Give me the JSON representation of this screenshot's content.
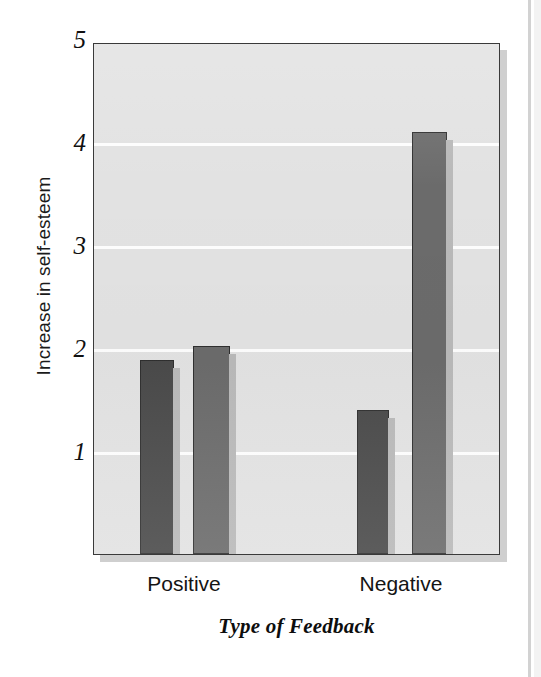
{
  "figure": {
    "kind": "bar-chart",
    "background_color": "#ffffff",
    "plot_background_color": "#e2e2e2",
    "plot_border_color": "#3a3a3a",
    "gridline_color": "#fdfdfd",
    "shadow_color": "#cfcfcf"
  },
  "axes": {
    "y_title": "Increase in self-esteem",
    "x_title": "Type of Feedback",
    "y_ticks": [
      "5",
      "4",
      "3",
      "2",
      "1"
    ],
    "x_ticks": [
      "Positive",
      "Negative"
    ]
  },
  "chart_data": {
    "type": "bar",
    "title": "",
    "xlabel": "Type of Feedback",
    "ylabel": "Increase in self-esteem",
    "categories": [
      "Positive",
      "Negative"
    ],
    "ylim": [
      0,
      5
    ],
    "yticks": [
      1,
      2,
      3,
      4,
      5
    ],
    "grid": true,
    "legend": "none",
    "series": [
      {
        "name": "Bar 1",
        "color": "#4a4a4a",
        "values": [
          1.88,
          1.4
        ]
      },
      {
        "name": "Bar 2",
        "color": "#6b6b6b",
        "values": [
          2.02,
          4.1
        ]
      }
    ],
    "bars": [
      {
        "group": "Positive",
        "index": 0,
        "value": 1.88,
        "color": "#4a4a4a"
      },
      {
        "group": "Positive",
        "index": 1,
        "value": 2.02,
        "color": "#6b6b6b"
      },
      {
        "group": "Negative",
        "index": 0,
        "value": 1.4,
        "color": "#4a4a4a"
      },
      {
        "group": "Negative",
        "index": 1,
        "value": 4.1,
        "color": "#6b6b6b"
      }
    ]
  }
}
